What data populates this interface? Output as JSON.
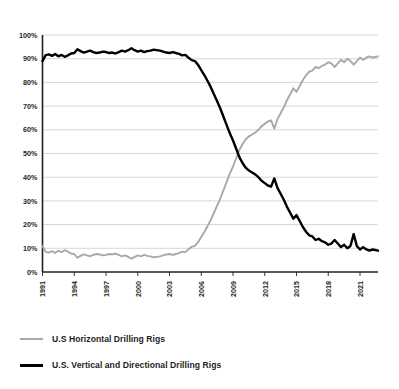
{
  "chart_data": {
    "type": "line",
    "title": "",
    "subtitle": "",
    "xlabel": "",
    "ylabel": "",
    "xlim": [
      1991.0,
      2022.7
    ],
    "ylim": [
      0,
      100
    ],
    "y_tick_labels": [
      "0%",
      "10%",
      "20%",
      "30%",
      "40%",
      "50%",
      "60%",
      "70%",
      "80%",
      "90%",
      "100%"
    ],
    "y_tick_values": [
      0,
      10,
      20,
      30,
      40,
      50,
      60,
      70,
      80,
      90,
      100
    ],
    "x_tick_labels": [
      "1991",
      "1994",
      "1997",
      "2000",
      "2003",
      "2006",
      "2009",
      "2012",
      "2015",
      "2018",
      "2021"
    ],
    "x_tick_values": [
      1991,
      1994,
      1997,
      2000,
      2003,
      2006,
      2009,
      2012,
      2015,
      2018,
      2021
    ],
    "grid": "horizontal",
    "legend_position": "below-left",
    "colors": {
      "horizontal": "#a9a9a9",
      "vertical_directional": "#000000",
      "grid": "#d3d3d3",
      "axis": "#231f20",
      "text": "#231f20",
      "background": "#ffffff"
    },
    "series": [
      {
        "name": "U.S Horizontal Drilling Rigs",
        "color": "#a9a9a9",
        "x": [
          1991.0,
          1991.3,
          1991.6,
          1991.9,
          1992.2,
          1992.5,
          1992.8,
          1993.1,
          1993.4,
          1993.7,
          1994.0,
          1994.3,
          1994.6,
          1994.9,
          1995.2,
          1995.5,
          1995.8,
          1996.1,
          1996.4,
          1996.7,
          1997.0,
          1997.3,
          1997.6,
          1997.9,
          1998.2,
          1998.5,
          1998.8,
          1999.1,
          1999.4,
          1999.7,
          2000.0,
          2000.3,
          2000.6,
          2000.9,
          2001.2,
          2001.5,
          2001.8,
          2002.1,
          2002.4,
          2002.7,
          2003.0,
          2003.3,
          2003.6,
          2003.9,
          2004.2,
          2004.5,
          2004.8,
          2005.1,
          2005.4,
          2005.7,
          2006.0,
          2006.3,
          2006.6,
          2006.9,
          2007.2,
          2007.5,
          2007.8,
          2008.1,
          2008.4,
          2008.7,
          2009.0,
          2009.3,
          2009.6,
          2009.9,
          2010.2,
          2010.5,
          2010.8,
          2011.1,
          2011.4,
          2011.7,
          2012.0,
          2012.3,
          2012.6,
          2012.9,
          2013.2,
          2013.5,
          2013.8,
          2014.1,
          2014.4,
          2014.7,
          2015.0,
          2015.3,
          2015.6,
          2015.9,
          2016.2,
          2016.5,
          2016.8,
          2017.1,
          2017.4,
          2017.7,
          2018.0,
          2018.3,
          2018.6,
          2018.9,
          2019.2,
          2019.5,
          2019.8,
          2020.1,
          2020.4,
          2020.7,
          2021.0,
          2021.3,
          2021.6,
          2021.9,
          2022.2,
          2022.7
        ],
        "values": [
          11.0,
          8.5,
          8.2,
          8.8,
          8.0,
          9.0,
          8.4,
          9.2,
          8.6,
          7.8,
          7.6,
          6.0,
          6.8,
          7.4,
          7.0,
          6.6,
          7.2,
          7.6,
          7.4,
          7.0,
          7.2,
          7.6,
          7.4,
          7.8,
          7.2,
          6.6,
          7.0,
          6.4,
          5.6,
          6.4,
          7.0,
          6.6,
          7.2,
          6.8,
          6.6,
          6.2,
          6.4,
          6.6,
          7.0,
          7.4,
          7.6,
          7.2,
          7.6,
          8.0,
          8.6,
          8.4,
          9.6,
          10.6,
          11.0,
          12.6,
          14.8,
          17.0,
          19.4,
          22.0,
          25.0,
          28.0,
          31.0,
          34.5,
          38.0,
          41.5,
          44.5,
          48.0,
          51.5,
          54.0,
          56.0,
          57.2,
          58.0,
          58.8,
          60.0,
          61.5,
          62.5,
          63.5,
          64.0,
          60.5,
          64.5,
          67.0,
          69.5,
          72.5,
          75.0,
          77.5,
          76.0,
          78.5,
          81.0,
          83.0,
          84.5,
          85.0,
          86.5,
          86.0,
          87.0,
          87.5,
          88.5,
          88.0,
          86.5,
          88.0,
          89.5,
          88.5,
          90.0,
          89.0,
          87.5,
          89.0,
          90.5,
          89.5,
          90.5,
          91.0,
          90.5,
          91.0
        ]
      },
      {
        "name": "U.S. Vertical and Directional Drilling Rigs",
        "color": "#000000",
        "x": [
          1991.0,
          1991.3,
          1991.6,
          1991.9,
          1992.2,
          1992.5,
          1992.8,
          1993.1,
          1993.4,
          1993.7,
          1994.0,
          1994.3,
          1994.6,
          1994.9,
          1995.2,
          1995.5,
          1995.8,
          1996.1,
          1996.4,
          1996.7,
          1997.0,
          1997.3,
          1997.6,
          1997.9,
          1998.2,
          1998.5,
          1998.8,
          1999.1,
          1999.4,
          1999.7,
          2000.0,
          2000.3,
          2000.6,
          2000.9,
          2001.2,
          2001.5,
          2001.8,
          2002.1,
          2002.4,
          2002.7,
          2003.0,
          2003.3,
          2003.6,
          2003.9,
          2004.2,
          2004.5,
          2004.8,
          2005.1,
          2005.4,
          2005.7,
          2006.0,
          2006.3,
          2006.6,
          2006.9,
          2007.2,
          2007.5,
          2007.8,
          2008.1,
          2008.4,
          2008.7,
          2009.0,
          2009.3,
          2009.6,
          2009.9,
          2010.2,
          2010.5,
          2010.8,
          2011.1,
          2011.4,
          2011.7,
          2012.0,
          2012.3,
          2012.6,
          2012.9,
          2013.2,
          2013.5,
          2013.8,
          2014.1,
          2014.4,
          2014.7,
          2015.0,
          2015.3,
          2015.6,
          2015.9,
          2016.2,
          2016.5,
          2016.8,
          2017.1,
          2017.4,
          2017.7,
          2018.0,
          2018.3,
          2018.6,
          2018.9,
          2019.2,
          2019.5,
          2019.8,
          2020.1,
          2020.4,
          2020.7,
          2021.0,
          2021.3,
          2021.6,
          2021.9,
          2022.2,
          2022.7
        ],
        "values": [
          89.0,
          91.5,
          91.8,
          91.2,
          92.0,
          91.0,
          91.6,
          90.8,
          91.4,
          92.2,
          92.4,
          94.0,
          93.2,
          92.6,
          93.0,
          93.4,
          92.8,
          92.4,
          92.6,
          93.0,
          92.8,
          92.4,
          92.6,
          92.2,
          92.8,
          93.4,
          93.0,
          93.6,
          94.4,
          93.6,
          93.0,
          93.4,
          92.8,
          93.2,
          93.4,
          93.8,
          93.6,
          93.4,
          93.0,
          92.6,
          92.4,
          92.8,
          92.4,
          92.0,
          91.4,
          91.6,
          90.4,
          89.4,
          89.0,
          87.4,
          85.2,
          83.0,
          80.6,
          78.0,
          75.0,
          72.0,
          69.0,
          65.5,
          62.0,
          58.5,
          55.5,
          52.0,
          48.5,
          46.0,
          44.0,
          42.8,
          42.0,
          41.2,
          40.0,
          38.5,
          37.5,
          36.5,
          36.0,
          39.5,
          35.5,
          33.0,
          30.5,
          27.5,
          25.0,
          22.5,
          24.0,
          21.5,
          19.0,
          17.0,
          15.5,
          15.0,
          13.5,
          14.0,
          13.0,
          12.5,
          11.5,
          12.0,
          13.5,
          12.0,
          10.5,
          11.5,
          10.0,
          11.0,
          16.0,
          11.0,
          9.5,
          10.5,
          9.5,
          9.0,
          9.5,
          9.0
        ]
      }
    ]
  },
  "legend": {
    "items": [
      {
        "label": "U.S Horizontal Drilling Rigs",
        "swatch": "gray"
      },
      {
        "label": "U.S. Vertical and Directional Drilling Rigs",
        "swatch": "black"
      }
    ]
  }
}
